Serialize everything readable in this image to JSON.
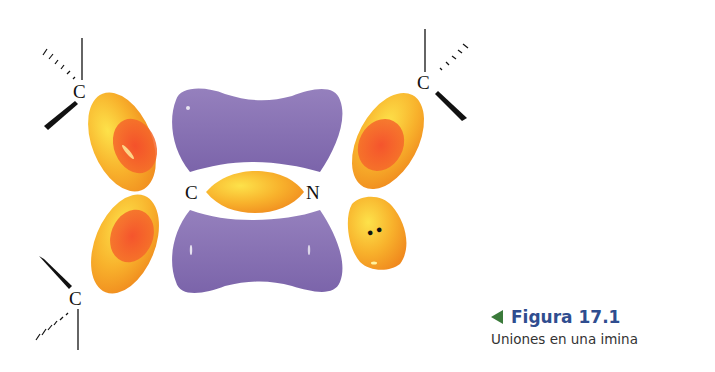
{
  "figure": {
    "atoms": {
      "top_left": "C",
      "top_right": "C",
      "bottom_left": "C",
      "bottom_right_none": "",
      "center_left": "C",
      "center_right": "N"
    },
    "lone_pair": "••",
    "colors": {
      "pi_lobe": "#8a70b4",
      "sigma_lobe": "#f5a623",
      "sigma_lobe_light": "#fbd23a",
      "overlap": "#f2492a",
      "bond": "#111111"
    }
  },
  "caption": {
    "title": "Figura 17.1",
    "subtitle": "Uniones en una imina",
    "arrow_color": "#3a7a3a",
    "title_color": "#2f4d8f"
  }
}
